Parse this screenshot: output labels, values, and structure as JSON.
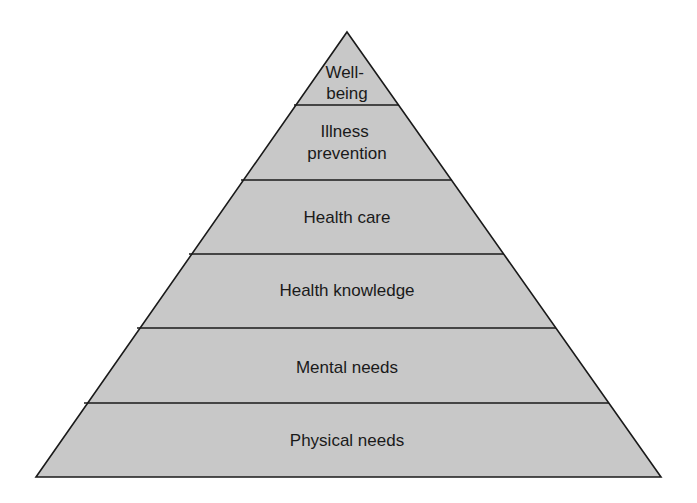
{
  "diagram": {
    "type": "pyramid",
    "fill_color": "#c8c8c8",
    "stroke_color": "#1a1a1a",
    "levels": [
      {
        "label_lines": [
          "Well-",
          "being"
        ]
      },
      {
        "label_lines": [
          "Illness",
          "prevention"
        ]
      },
      {
        "label_lines": [
          "Health care"
        ]
      },
      {
        "label_lines": [
          "Health knowledge"
        ]
      },
      {
        "label_lines": [
          "Mental needs"
        ]
      },
      {
        "label_lines": [
          "Physical needs"
        ]
      }
    ]
  }
}
